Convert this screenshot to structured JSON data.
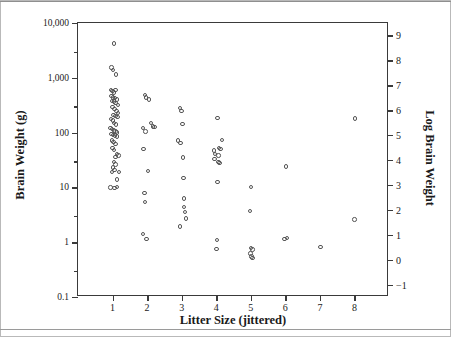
{
  "figure": {
    "background": "#ffffff",
    "frame_color": "#3a3a3a",
    "marker_color": "#555555"
  },
  "chart_data": {
    "type": "scatter",
    "title": "",
    "xlabel": "Litter Size (jittered)",
    "ylabel": "Brain Weight (g)",
    "y2label": "Log Brain Weight",
    "xlim": [
      0,
      9
    ],
    "ylim": [
      0.1,
      10000
    ],
    "yscale": "log",
    "y2lim": [
      -1.5,
      9.5
    ],
    "grid": false,
    "legend": null,
    "xticks": [
      1,
      2,
      3,
      4,
      5,
      6,
      7,
      8
    ],
    "xticklabels": [
      "1",
      "2",
      "3",
      "4",
      "5",
      "6",
      "7",
      "8"
    ],
    "yticks": [
      10000,
      1000,
      100,
      10,
      1,
      0.1
    ],
    "yticklabels": [
      "10,000",
      "1,000",
      "100",
      "10",
      "1",
      "0.1"
    ],
    "y_minor_ticks": [
      3000,
      300,
      30,
      3,
      0.3
    ],
    "y2ticks": [
      9,
      8,
      7,
      6,
      5,
      4,
      3,
      2,
      1,
      0,
      -1
    ],
    "y2ticklabels": [
      "9",
      "8",
      "7",
      "6",
      "5",
      "4",
      "3",
      "2",
      "1",
      "0",
      "−1"
    ],
    "marker": "open-circle",
    "points": [
      {
        "x": 1.04,
        "y": 4200
      },
      {
        "x": 0.97,
        "y": 1550
      },
      {
        "x": 1.02,
        "y": 1380
      },
      {
        "x": 1.1,
        "y": 1150
      },
      {
        "x": 0.95,
        "y": 600
      },
      {
        "x": 1.0,
        "y": 580
      },
      {
        "x": 1.05,
        "y": 540
      },
      {
        "x": 1.09,
        "y": 600
      },
      {
        "x": 0.97,
        "y": 470
      },
      {
        "x": 1.02,
        "y": 440
      },
      {
        "x": 1.07,
        "y": 430
      },
      {
        "x": 1.12,
        "y": 400
      },
      {
        "x": 0.99,
        "y": 380
      },
      {
        "x": 1.04,
        "y": 370
      },
      {
        "x": 1.09,
        "y": 350
      },
      {
        "x": 1.15,
        "y": 320
      },
      {
        "x": 1.0,
        "y": 290
      },
      {
        "x": 1.06,
        "y": 270
      },
      {
        "x": 1.11,
        "y": 250
      },
      {
        "x": 1.16,
        "y": 230
      },
      {
        "x": 1.03,
        "y": 210
      },
      {
        "x": 1.08,
        "y": 200
      },
      {
        "x": 1.14,
        "y": 195
      },
      {
        "x": 0.96,
        "y": 175
      },
      {
        "x": 1.01,
        "y": 165
      },
      {
        "x": 1.05,
        "y": 150
      },
      {
        "x": 1.1,
        "y": 140
      },
      {
        "x": 0.94,
        "y": 120
      },
      {
        "x": 0.99,
        "y": 115
      },
      {
        "x": 1.04,
        "y": 110
      },
      {
        "x": 1.09,
        "y": 105
      },
      {
        "x": 1.13,
        "y": 100
      },
      {
        "x": 0.97,
        "y": 95
      },
      {
        "x": 1.02,
        "y": 90
      },
      {
        "x": 1.07,
        "y": 88
      },
      {
        "x": 1.12,
        "y": 85
      },
      {
        "x": 0.98,
        "y": 72
      },
      {
        "x": 1.03,
        "y": 68
      },
      {
        "x": 1.08,
        "y": 62
      },
      {
        "x": 1.0,
        "y": 52
      },
      {
        "x": 1.05,
        "y": 48
      },
      {
        "x": 1.13,
        "y": 41
      },
      {
        "x": 1.17,
        "y": 38
      },
      {
        "x": 1.09,
        "y": 36
      },
      {
        "x": 1.04,
        "y": 29
      },
      {
        "x": 1.08,
        "y": 26
      },
      {
        "x": 1.02,
        "y": 23
      },
      {
        "x": 1.06,
        "y": 21
      },
      {
        "x": 0.99,
        "y": 19
      },
      {
        "x": 1.18,
        "y": 19
      },
      {
        "x": 1.13,
        "y": 14
      },
      {
        "x": 0.94,
        "y": 10
      },
      {
        "x": 1.06,
        "y": 9.8
      },
      {
        "x": 1.12,
        "y": 10.2
      },
      {
        "x": 1.93,
        "y": 490
      },
      {
        "x": 1.97,
        "y": 440
      },
      {
        "x": 2.05,
        "y": 400
      },
      {
        "x": 2.12,
        "y": 150
      },
      {
        "x": 2.17,
        "y": 130
      },
      {
        "x": 2.21,
        "y": 128
      },
      {
        "x": 1.88,
        "y": 120
      },
      {
        "x": 1.95,
        "y": 105
      },
      {
        "x": 1.9,
        "y": 50
      },
      {
        "x": 2.03,
        "y": 20
      },
      {
        "x": 1.92,
        "y": 8.0
      },
      {
        "x": 1.94,
        "y": 5.4
      },
      {
        "x": 1.88,
        "y": 1.4
      },
      {
        "x": 1.98,
        "y": 1.15
      },
      {
        "x": 2.96,
        "y": 280
      },
      {
        "x": 2.99,
        "y": 250
      },
      {
        "x": 3.02,
        "y": 145
      },
      {
        "x": 2.89,
        "y": 72
      },
      {
        "x": 2.97,
        "y": 64
      },
      {
        "x": 3.03,
        "y": 35
      },
      {
        "x": 3.05,
        "y": 15
      },
      {
        "x": 3.06,
        "y": 6.3
      },
      {
        "x": 3.07,
        "y": 4.4
      },
      {
        "x": 3.09,
        "y": 3.6
      },
      {
        "x": 3.12,
        "y": 2.7
      },
      {
        "x": 2.95,
        "y": 1.95
      },
      {
        "x": 4.04,
        "y": 185
      },
      {
        "x": 4.16,
        "y": 74
      },
      {
        "x": 3.93,
        "y": 47
      },
      {
        "x": 4.08,
        "y": 52
      },
      {
        "x": 4.12,
        "y": 50
      },
      {
        "x": 3.97,
        "y": 41
      },
      {
        "x": 4.06,
        "y": 38
      },
      {
        "x": 3.95,
        "y": 33
      },
      {
        "x": 4.07,
        "y": 29
      },
      {
        "x": 4.09,
        "y": 28
      },
      {
        "x": 4.04,
        "y": 12.5
      },
      {
        "x": 4.03,
        "y": 1.1
      },
      {
        "x": 4.01,
        "y": 0.76
      },
      {
        "x": 5.0,
        "y": 10.3
      },
      {
        "x": 4.98,
        "y": 3.7
      },
      {
        "x": 5.01,
        "y": 0.78
      },
      {
        "x": 5.05,
        "y": 0.74
      },
      {
        "x": 4.99,
        "y": 0.62
      },
      {
        "x": 5.02,
        "y": 0.55
      },
      {
        "x": 5.05,
        "y": 0.52
      },
      {
        "x": 6.02,
        "y": 24
      },
      {
        "x": 5.97,
        "y": 1.15
      },
      {
        "x": 6.05,
        "y": 1.18
      },
      {
        "x": 7.02,
        "y": 0.82
      },
      {
        "x": 8.02,
        "y": 180
      },
      {
        "x": 8.0,
        "y": 2.6
      }
    ]
  }
}
